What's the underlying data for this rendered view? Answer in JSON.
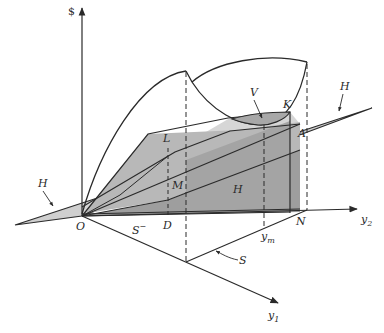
{
  "figure": {
    "type": "3D economic diagram",
    "axes": {
      "vertical": "$",
      "horizontal_right": "y2",
      "horizontal_right_sub": "2",
      "horizontal_right_base": "y",
      "depth": "y1",
      "depth_sub": "1",
      "depth_base": "y",
      "origin": "O"
    },
    "labels": {
      "L": "L",
      "M": "M",
      "D": "D",
      "N": "N",
      "K": "K",
      "A": "A",
      "V": "V",
      "H_left": "H",
      "H_right": "H",
      "H_center": "H",
      "S_minus": "S",
      "S_minus_sup": "−",
      "S": "S",
      "ym_base": "y",
      "ym_sub": "m"
    },
    "colors": {
      "line": "#2a2a2a",
      "plane_light": "#cfcfcf",
      "plane_mid": "#b4b4b4",
      "plane_dark": "#9a9a9a",
      "cap_shade": "#a8a8a8",
      "background": "#ffffff"
    }
  }
}
